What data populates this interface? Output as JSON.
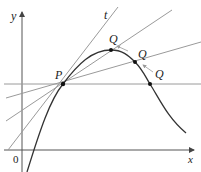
{
  "diagram": {
    "axes": {
      "x_label": "x",
      "y_label": "y",
      "origin_label": "0"
    },
    "point_p": {
      "label": "P"
    },
    "points_q": [
      {
        "label": "Q"
      },
      {
        "label": "Q"
      },
      {
        "label": "Q"
      }
    ],
    "tangent": {
      "label": "t"
    },
    "colors": {
      "curve": "#333333",
      "secant": "#9a9a9a",
      "axis": "#555555",
      "point": "#111111"
    }
  }
}
